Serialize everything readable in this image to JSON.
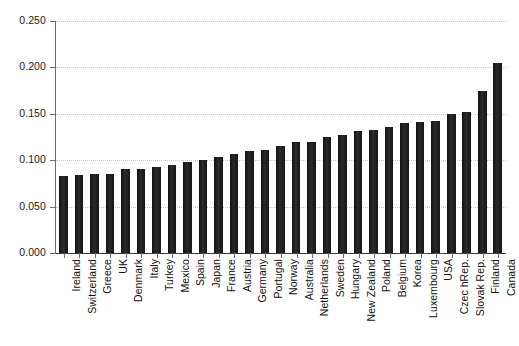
{
  "chart_data": {
    "type": "bar",
    "title": "",
    "subtitle": "",
    "xlabel": "",
    "ylabel": "",
    "ylim": [
      0.0,
      0.25
    ],
    "yticks": [
      0.0,
      0.05,
      0.1,
      0.15,
      0.2,
      0.25
    ],
    "ytick_labels": [
      "0.000",
      "0.050",
      "0.100",
      "0.150",
      "0.200",
      "0.250"
    ],
    "grid": true,
    "grid_axis": "y",
    "grid_style": "dotted",
    "legend": false,
    "bar_color": "#1a1a1a",
    "background_color": "#ffffff",
    "axis_color": "#6e6e6e",
    "categories": [
      "Ireland",
      "Switzerland",
      "Greece",
      "UK",
      "Denmark",
      "Italy",
      "Turkey",
      "Mexico",
      "Spain",
      "Japan",
      "France",
      "Austria",
      "Germany",
      "Portugal",
      "Norway",
      "Australia",
      "Netherlands",
      "Sweden",
      "Hungary",
      "New Zealand",
      "Poland",
      "Belgium",
      "Korea",
      "Luxembourg",
      "USA",
      "Czec hRep.",
      "Slovak Rep.",
      "Finland",
      "Canada"
    ],
    "values": [
      0.083,
      0.084,
      0.085,
      0.085,
      0.091,
      0.091,
      0.093,
      0.095,
      0.098,
      0.1,
      0.103,
      0.107,
      0.11,
      0.111,
      0.115,
      0.12,
      0.12,
      0.125,
      0.127,
      0.131,
      0.133,
      0.136,
      0.14,
      0.141,
      0.142,
      0.15,
      0.152,
      0.175,
      0.205
    ]
  }
}
